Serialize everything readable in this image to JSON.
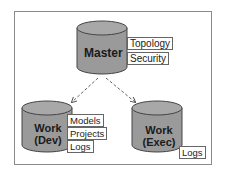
{
  "diagram": {
    "colors": {
      "cylinder_fill": "#9a9a9a",
      "cylinder_top": "#a8a8a8",
      "cylinder_stroke": "#444444",
      "arrow": "#666666",
      "frame": "#8a8a8a"
    },
    "nodes": [
      {
        "id": "master",
        "label": "Master",
        "tags": [
          "Topology",
          "Security"
        ]
      },
      {
        "id": "work-dev",
        "label_line1": "Work",
        "label_line2": "(Dev)",
        "tags": [
          "Models",
          "Projects",
          "Logs"
        ]
      },
      {
        "id": "work-exec",
        "label_line1": "Work",
        "label_line2": "(Exec)",
        "tags": [
          "Logs"
        ]
      }
    ],
    "edges": [
      {
        "from": "master",
        "to": "work-dev",
        "style": "dashed-arrow"
      },
      {
        "from": "master",
        "to": "work-exec",
        "style": "dashed-arrow"
      }
    ]
  }
}
